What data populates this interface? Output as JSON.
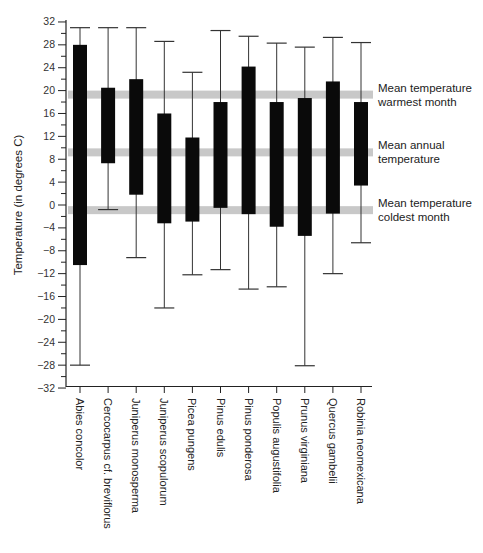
{
  "chart_data": {
    "type": "bar",
    "subtype": "floating-range-with-whiskers",
    "title": "",
    "xlabel": "",
    "ylabel": "Temperature (in degrees C)",
    "ylim": [
      -32,
      32
    ],
    "yticks": [
      32,
      28,
      24,
      20,
      16,
      12,
      8,
      4,
      0,
      -4,
      -8,
      -12,
      -16,
      -20,
      -24,
      -28,
      -32
    ],
    "grid": false,
    "categories": [
      "Abies concolor",
      "Cercocarpus cf. breviflorus",
      "Juniperus monosperma",
      "Juniperus scopulorum",
      "Picea pungens",
      "Pinus edulis",
      "Pinus ponderosa",
      "Populis augustifolia",
      "Prunus virginiana",
      "Quercus gambelii",
      "Robinia neomexicana"
    ],
    "series": [
      {
        "name": "Whisker max",
        "values": [
          31,
          31,
          31,
          28.6,
          23.2,
          30.5,
          29.5,
          28.3,
          27.6,
          29.3,
          28.4
        ]
      },
      {
        "name": "Bar top",
        "values": [
          28,
          20.5,
          22,
          16,
          11.8,
          18,
          24.2,
          18,
          18.7,
          21.6,
          18
        ]
      },
      {
        "name": "Bar bottom",
        "values": [
          -10.5,
          7.3,
          1.8,
          -3.2,
          -2.9,
          -0.5,
          -1.6,
          -3.8,
          -5.4,
          -1.5,
          3.4
        ]
      },
      {
        "name": "Whisker min",
        "values": [
          -28,
          -0.8,
          -9.2,
          -18,
          -12.2,
          -11.3,
          -14.7,
          -14.3,
          -28.1,
          -12,
          -6.6
        ]
      }
    ],
    "reference_bands": [
      {
        "label_line1": "Mean temperature",
        "label_line2": "warmest month",
        "value": 19.3
      },
      {
        "label_line1": "Mean annual",
        "label_line2": "temperature",
        "value": 9.2
      },
      {
        "label_line1": "Mean temperature",
        "label_line2": "coldest month",
        "value": -0.9
      }
    ],
    "legend_position": "right",
    "colors": {
      "bar": "#0a0a0a",
      "whisker": "#333333",
      "band": "#c8c8c8",
      "axis": "#222222"
    }
  }
}
